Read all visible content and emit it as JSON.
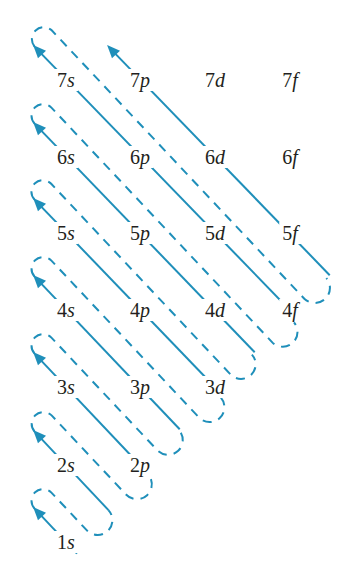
{
  "colors": {
    "line": "#1f8fba",
    "text": "#231f20",
    "background": "#ffffff"
  },
  "grid": {
    "columns": {
      "s": 66,
      "p": 140,
      "d": 215,
      "f": 290
    },
    "rows": {
      "7": 80,
      "6": 157,
      "5": 233,
      "4": 310,
      "3": 387,
      "2": 465,
      "1": 542
    }
  },
  "labels": [
    {
      "id": "7s",
      "n": "7",
      "l": "s"
    },
    {
      "id": "7p",
      "n": "7",
      "l": "p"
    },
    {
      "id": "7d",
      "n": "7",
      "l": "d"
    },
    {
      "id": "7f",
      "n": "7",
      "l": "f"
    },
    {
      "id": "6s",
      "n": "6",
      "l": "s"
    },
    {
      "id": "6p",
      "n": "6",
      "l": "p"
    },
    {
      "id": "6d",
      "n": "6",
      "l": "d"
    },
    {
      "id": "6f",
      "n": "6",
      "l": "f"
    },
    {
      "id": "5s",
      "n": "5",
      "l": "s"
    },
    {
      "id": "5p",
      "n": "5",
      "l": "p"
    },
    {
      "id": "5d",
      "n": "5",
      "l": "d"
    },
    {
      "id": "5f",
      "n": "5",
      "l": "f"
    },
    {
      "id": "4s",
      "n": "4",
      "l": "s"
    },
    {
      "id": "4p",
      "n": "4",
      "l": "p"
    },
    {
      "id": "4d",
      "n": "4",
      "l": "d"
    },
    {
      "id": "4f",
      "n": "4",
      "l": "f"
    },
    {
      "id": "3s",
      "n": "3",
      "l": "s"
    },
    {
      "id": "3p",
      "n": "3",
      "l": "p"
    },
    {
      "id": "3d",
      "n": "3",
      "l": "d"
    },
    {
      "id": "2s",
      "n": "2",
      "l": "s"
    },
    {
      "id": "2p",
      "n": "2",
      "l": "p"
    },
    {
      "id": "1s",
      "n": "1",
      "l": "s"
    }
  ],
  "diagonals": [
    {
      "order": 1,
      "orbitals": [
        "1s"
      ],
      "tail_extension": 16
    },
    {
      "order": 2,
      "orbitals": [
        "2s"
      ],
      "tail_extension": 62
    },
    {
      "order": 3,
      "orbitals": [
        "3s",
        "2p"
      ],
      "tail_extension": 12
    },
    {
      "order": 4,
      "orbitals": [
        "4s",
        "3p"
      ],
      "tail_extension": 58
    },
    {
      "order": 5,
      "orbitals": [
        "5s",
        "4p",
        "3d"
      ],
      "tail_extension": 12
    },
    {
      "order": 6,
      "orbitals": [
        "6s",
        "5p",
        "4d"
      ],
      "tail_extension": 58
    },
    {
      "order": 7,
      "orbitals": [
        "7s",
        "6p",
        "5d",
        "4f"
      ],
      "tail_extension": 12
    },
    {
      "order": 8,
      "orbitals": [
        "7p",
        "6d",
        "5f"
      ],
      "tail_extension": 58
    }
  ],
  "filling_order": [
    "1s",
    "2s",
    "2p",
    "3s",
    "3p",
    "4s",
    "3d",
    "4p",
    "5s",
    "4d",
    "5p",
    "6s",
    "4f",
    "5d",
    "6p",
    "7s",
    "5f",
    "6d",
    "7p"
  ]
}
